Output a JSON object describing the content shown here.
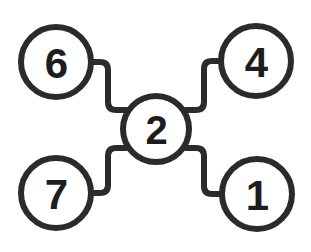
{
  "diagram": {
    "type": "node-link-graph",
    "title": "",
    "background_color": "#ffffff",
    "stroke_color": "#2b2b2b",
    "label_color": "#1d1d1d",
    "node_fill": "#ffffff",
    "stroke_width": 6,
    "hub_id": "2",
    "nodes": [
      {
        "id": "6",
        "label": "6",
        "cx": 56,
        "cy": 62,
        "r": 35,
        "role": "leaf",
        "position": "top-left"
      },
      {
        "id": "4",
        "label": "4",
        "cx": 256,
        "cy": 61,
        "r": 35,
        "role": "leaf",
        "position": "top-right"
      },
      {
        "id": "2",
        "label": "2",
        "cx": 156,
        "cy": 129,
        "r": 33,
        "role": "hub",
        "position": "center"
      },
      {
        "id": "7",
        "label": "7",
        "cx": 56,
        "cy": 193,
        "r": 35,
        "role": "leaf",
        "position": "bottom-left"
      },
      {
        "id": "1",
        "label": "1",
        "cx": 257,
        "cy": 194,
        "r": 35,
        "role": "leaf",
        "position": "bottom-right"
      }
    ],
    "edges": [
      {
        "id": "edge-6-2",
        "from": "6",
        "to": "2",
        "style": "orthogonal-rounded"
      },
      {
        "id": "edge-4-2",
        "from": "4",
        "to": "2",
        "style": "orthogonal-rounded"
      },
      {
        "id": "edge-7-2",
        "from": "7",
        "to": "2",
        "style": "orthogonal-rounded"
      },
      {
        "id": "edge-1-2",
        "from": "1",
        "to": "2",
        "style": "orthogonal-rounded"
      }
    ]
  }
}
